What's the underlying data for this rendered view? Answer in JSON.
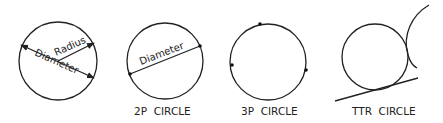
{
  "diagram": {
    "type": "circle-construction-methods",
    "panels": [
      {
        "id": "center-radius",
        "caption": "",
        "labels": {
          "radius": "Radius",
          "diameter": "Diameter"
        }
      },
      {
        "id": "2p",
        "caption": "2P  CIRCLE",
        "labels": {
          "diameter": "Diameter"
        },
        "points": 2
      },
      {
        "id": "3p",
        "caption": "3P  CIRCLE",
        "points": 3
      },
      {
        "id": "ttr",
        "caption": "TTR  CIRCLE",
        "tangent_objects": [
          "line",
          "arc"
        ]
      }
    ],
    "colors": {
      "stroke": "#222222",
      "background": "#ffffff"
    }
  }
}
